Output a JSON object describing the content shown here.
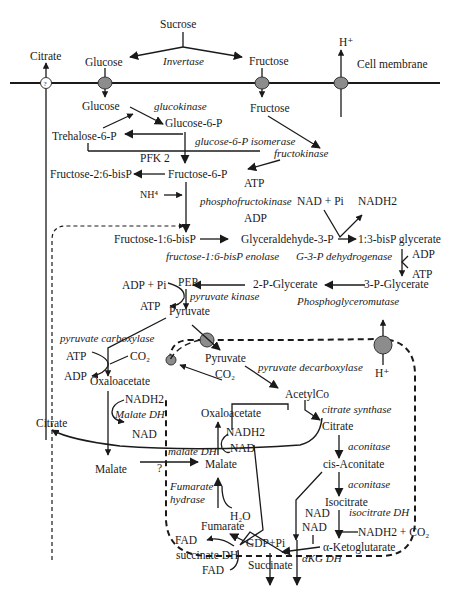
{
  "figure": {
    "type": "metabolic-pathway-diagram",
    "membrane_label": "Cell membrane",
    "colors": {
      "line": "#1a1a1a",
      "transporter": "#8c8c8c",
      "background": "#ffffff"
    }
  },
  "extracellular": {
    "sucrose": "Sucrose",
    "invertase": "Invertase",
    "glucose": "Glucose",
    "fructose": "Fructose",
    "citrate": "Citrate",
    "h_plus": "H⁺"
  },
  "glycolysis": {
    "glucose": "Glucose",
    "glucokinase": "glucokinase",
    "glucose_6_p": "Glucose-6-P",
    "trehalose_6_p": "Trehalose-6-P",
    "fructose": "Fructose",
    "g6p_isomerase": "glucose-6-P isomerase",
    "fructokinase": "fructokinase",
    "pfk2": "PFK 2",
    "fructose_2_6_bisp": "Fructose-2:6-bisP",
    "fructose_6_p": "Fructose-6-P",
    "nh4": "NH⁴",
    "atp1": "ATP",
    "phosphofructokinase": "phosphofructokinase",
    "adp1": "ADP",
    "nad_pi": "NAD + Pi",
    "nadh2": "NADH2",
    "fructose_1_6_bisp": "Fructose-1:6-bisP",
    "glyceraldehyde_3_p": "Glyceraldehyde-3-P",
    "bisp_glycerate": "1:3-bisP glycerate",
    "f16bp_enolase": "fructose-1:6-bisP enolase",
    "g3p_dh": "G-3-P dehydrogenase",
    "adp2": "ADP",
    "atp2": "ATP",
    "adp_pi": "ADP + Pi",
    "pep": "PEP",
    "two_p_glycerate": "2-P-Glycerate",
    "three_p_glycerate": "3-P-Glycerate",
    "atp3": "ATP",
    "pyruvate_kinase": "pyruvate kinase",
    "phosphoglyceromutase": "Phosphoglyceromutase",
    "pyruvate": "Pyruvate"
  },
  "anaplerotic": {
    "pyruvate_carboxylase": "pyruvate carboxylase",
    "atp": "ATP",
    "co2": "CO₂",
    "adp": "ADP",
    "oxaloacetate": "Oxaloacetate",
    "nadh2": "NADH2",
    "malate_dh": "Malate DH",
    "nad": "NAD",
    "citrate": "Citrate",
    "malate": "Malate",
    "question": "?"
  },
  "mitochondrion": {
    "pyruvate": "Pyruvate",
    "co2": "CO₂",
    "h_plus": "H⁺",
    "pyruvate_decarboxylase": "pyruvate decarboxylase",
    "acetylco": "AcetylCo",
    "citrate_synthase": "citrate synthase",
    "oxaloacetate": "Oxaloacetate",
    "citrate": "Citrate",
    "nadh2": "NADH2",
    "nad": "NAD",
    "malate_dh": "malate DH",
    "malate": "Malate",
    "aconitase1": "aconitase",
    "cis_aconitate": "cis-Aconitate",
    "aconitase2": "aconitase",
    "fumarate_hydrase_1": "Fumarate",
    "fumarate_hydrase_2": "hydrase",
    "h2o": "H₂O",
    "fumarate": "Fumarate",
    "isocitrate": "Isocitrate",
    "isocitrate_dh": "isocitrate DH",
    "nad_a": "NAD",
    "nad_b": "NAD",
    "fad1": "FAD",
    "gdp_pi": "GDP+Pi",
    "nadh2_co2": "NADH2 + CO₂",
    "alpha_kg": "α-Ketoglutarate",
    "succinate_dh": "succinate DH",
    "fad2": "FAD",
    "succinate": "Succinate",
    "akg_dh": "αKG DH"
  }
}
